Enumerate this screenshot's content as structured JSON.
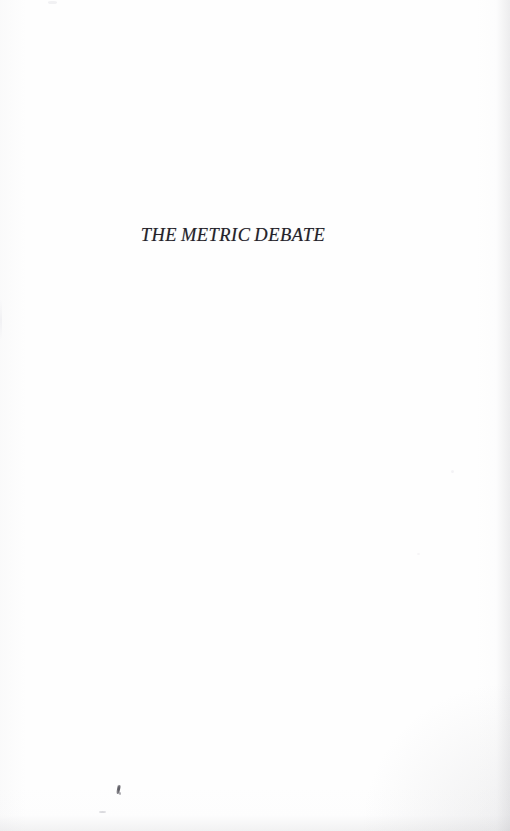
{
  "document": {
    "page_type": "half-title-page",
    "title": "THE METRIC DEBATE",
    "body_text": "",
    "page_number": ""
  },
  "appearance": {
    "paper_color": "#fefefe",
    "ink_color": "#24222a",
    "edge_shadow_color": "#c4c4c8",
    "artifact_color": "#4b4a52"
  },
  "artifacts": {
    "speck_primary_label": "ink-speck",
    "speck_secondary_label": "faint-smudge"
  }
}
